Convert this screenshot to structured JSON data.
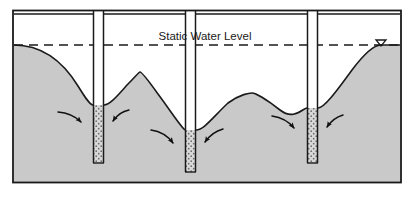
{
  "figure": {
    "frame": {
      "x": 12,
      "y": 10,
      "width": 390,
      "height": 178
    }
  },
  "labels": {
    "static_water_level": "Static Water Level"
  },
  "colors": {
    "soil_fill": "#c9c9c9",
    "unsaturated_fill": "#ffffff",
    "outline": "#1a1a1a",
    "screen_fill": "#d8d8d8",
    "screen_dots": "#6b6b6b",
    "casing_fill": "#ffffff",
    "water_level_line": "#1a1a1a",
    "arrow": "#111111"
  },
  "geometry": {
    "ground_surface_y": 14,
    "static_water_level_y": 45,
    "base_y": 182,
    "left_x": 14,
    "right_x": 400
  },
  "wells": [
    {
      "name": "well-1",
      "casing_left_x": 93,
      "casing_right_x": 104,
      "casing_top_y": 8,
      "screen_top_y": 105,
      "screen_bottom_y": 163,
      "drawdown_bottom_y": 105
    },
    {
      "name": "well-2",
      "casing_left_x": 185,
      "casing_right_x": 196,
      "casing_top_y": 8,
      "screen_top_y": 130,
      "screen_bottom_y": 172,
      "drawdown_bottom_y": 130
    },
    {
      "name": "well-3",
      "casing_left_x": 307,
      "casing_right_x": 318,
      "casing_top_y": 8,
      "screen_top_y": 108,
      "screen_bottom_y": 163,
      "drawdown_bottom_y": 108
    }
  ],
  "mounds": [
    {
      "name": "mound-1",
      "peak_x": 140,
      "peak_y": 72
    },
    {
      "name": "mound-2",
      "peak_x": 252,
      "peak_y": 93
    }
  ],
  "flow_arrows": [
    {
      "name": "flow-arrow-well1-left",
      "from_x": 58,
      "from_y": 114,
      "to_x": 84,
      "to_y": 125
    },
    {
      "name": "flow-arrow-well1-right",
      "from_x": 128,
      "from_y": 112,
      "to_x": 110,
      "to_y": 124
    },
    {
      "name": "flow-arrow-well2-left",
      "from_x": 152,
      "from_y": 132,
      "to_x": 176,
      "to_y": 147
    },
    {
      "name": "flow-arrow-well2-right",
      "from_x": 222,
      "from_y": 131,
      "to_x": 202,
      "to_y": 145
    },
    {
      "name": "flow-arrow-well3-left",
      "from_x": 272,
      "from_y": 118,
      "to_x": 297,
      "to_y": 131
    },
    {
      "name": "flow-arrow-well3-right",
      "from_x": 342,
      "from_y": 117,
      "to_x": 324,
      "to_y": 130
    }
  ],
  "water_level_marker": {
    "name": "water-table-triangle",
    "x": 381,
    "y": 43,
    "symbol": "triangle-down"
  }
}
